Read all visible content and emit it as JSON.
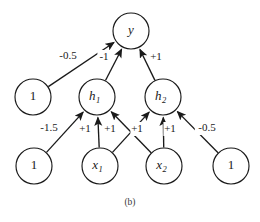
{
  "figure": {
    "caption": "(b)",
    "background_color": "#ffffff",
    "stroke_color": "#1a1a1a"
  },
  "nodes": [
    {
      "id": "y",
      "label": "y",
      "sub": "",
      "cx": 131,
      "cy": 31,
      "r": 18,
      "italic": true
    },
    {
      "id": "h1",
      "label": "h",
      "sub": "1",
      "cx": 97,
      "cy": 97,
      "r": 18,
      "italic": true
    },
    {
      "id": "h2",
      "label": "h",
      "sub": "2",
      "cx": 163,
      "cy": 97,
      "r": 18,
      "italic": true
    },
    {
      "id": "b1",
      "label": "1",
      "sub": "",
      "cx": 33,
      "cy": 97,
      "r": 18,
      "italic": false
    },
    {
      "id": "b2",
      "label": "1",
      "sub": "",
      "cx": 34,
      "cy": 166,
      "r": 18,
      "italic": false
    },
    {
      "id": "x1",
      "label": "x",
      "sub": "1",
      "cx": 100,
      "cy": 166,
      "r": 18,
      "italic": true
    },
    {
      "id": "x2",
      "label": "x",
      "sub": "2",
      "cx": 164,
      "cy": 166,
      "r": 18,
      "italic": true
    },
    {
      "id": "b3",
      "label": "1",
      "sub": "",
      "cx": 231,
      "cy": 166,
      "r": 18,
      "italic": false
    }
  ],
  "edges": [
    {
      "id": "b1-y",
      "from": "b1",
      "to": "y",
      "weight": "-0.5",
      "lx": 68,
      "ly": 56
    },
    {
      "id": "h1-y",
      "from": "h1",
      "to": "y",
      "weight": "-1",
      "lx": 104,
      "ly": 57
    },
    {
      "id": "h2-y",
      "from": "h2",
      "to": "y",
      "weight": "+1",
      "lx": 156,
      "ly": 57
    },
    {
      "id": "b2-h1",
      "from": "b2",
      "to": "h1",
      "weight": "-1.5",
      "lx": 49,
      "ly": 128
    },
    {
      "id": "x1-h1",
      "from": "x1",
      "to": "h1",
      "weight": "+1",
      "lx": 85,
      "ly": 129
    },
    {
      "id": "x2-h1",
      "from": "x2",
      "to": "h1",
      "weight": "+1",
      "lx": 110,
      "ly": 129
    },
    {
      "id": "x1-h2",
      "from": "x1",
      "to": "h2",
      "weight": "+1",
      "lx": 137,
      "ly": 129
    },
    {
      "id": "x2-h2",
      "from": "x2",
      "to": "h2",
      "weight": "+1",
      "lx": 170,
      "ly": 129
    },
    {
      "id": "b3-h2",
      "from": "b3",
      "to": "h2",
      "weight": "-0.5",
      "lx": 207,
      "ly": 128
    }
  ]
}
